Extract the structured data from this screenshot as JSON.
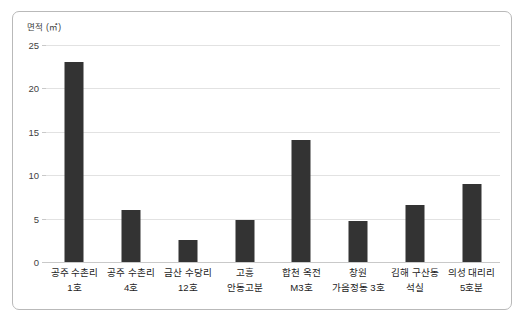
{
  "chart_data": {
    "type": "bar",
    "title": "",
    "xlabel": "",
    "ylabel": "면적 (㎡)",
    "ylim": [
      0,
      25
    ],
    "yticks": [
      0,
      5,
      10,
      15,
      20,
      25
    ],
    "grid": true,
    "legend": false,
    "bar_color": "#333333",
    "categories": [
      "공주 수촌리 1호",
      "공주 수촌리 4호",
      "금산 수당리 12호",
      "고흥 안동고분",
      "합천 옥전 M3호",
      "창원 가음정동 3호",
      "김해 구산동 석실",
      "의성 대리리 5호분"
    ],
    "category_lines": [
      [
        "공주 수촌리",
        "1호"
      ],
      [
        "공주 수촌리",
        "4호"
      ],
      [
        "금산 수당리",
        "12호"
      ],
      [
        "고흥",
        "안동고분"
      ],
      [
        "합천 옥전",
        "M3호"
      ],
      [
        "창원",
        "가음정동 3호"
      ],
      [
        "김해 구산동",
        "석실"
      ],
      [
        "의성 대리리",
        "5호분"
      ]
    ],
    "values": [
      23.1,
      6.0,
      2.5,
      4.8,
      14.0,
      4.7,
      6.6,
      9.0
    ]
  },
  "axis": {
    "y_title": "면적 (㎡)",
    "y_tick_labels": [
      "0",
      "5",
      "10",
      "15",
      "20",
      "25"
    ]
  }
}
